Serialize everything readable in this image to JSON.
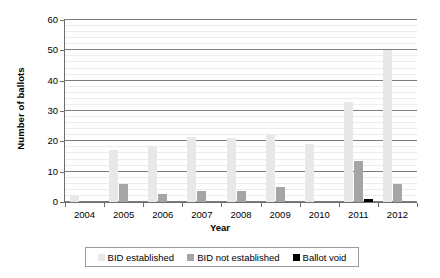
{
  "chart_data": {
    "type": "bar",
    "title": "",
    "xlabel": "Year",
    "ylabel": "Number of ballots",
    "categories": [
      "2004",
      "2005",
      "2006",
      "2007",
      "2008",
      "2009",
      "2010",
      "2011",
      "2012"
    ],
    "series": [
      {
        "name": "BID established",
        "color": "#e8e8e8",
        "values": [
          2,
          17,
          18.5,
          21.5,
          21,
          22,
          19,
          33,
          50
        ]
      },
      {
        "name": "BID not established",
        "color": "#a5a5a5",
        "values": [
          0,
          6,
          2.5,
          3.5,
          3.5,
          5,
          0,
          13.5,
          6
        ]
      },
      {
        "name": "Ballot void",
        "color": "#000000",
        "values": [
          0,
          0,
          0,
          0,
          0,
          0,
          0,
          1,
          0
        ]
      }
    ],
    "ylim": [
      0,
      60
    ],
    "yticks": [
      "0",
      "10",
      "20",
      "30",
      "40",
      "50",
      "60"
    ],
    "ytick_values": [
      0,
      10,
      20,
      30,
      40,
      50,
      60
    ],
    "minor_tick_step": 2,
    "grid": "horizontal",
    "legend_position": "bottom"
  },
  "legend": {
    "items": [
      {
        "label": "BID established"
      },
      {
        "label": "BID not established"
      },
      {
        "label": "Ballot void"
      }
    ]
  }
}
